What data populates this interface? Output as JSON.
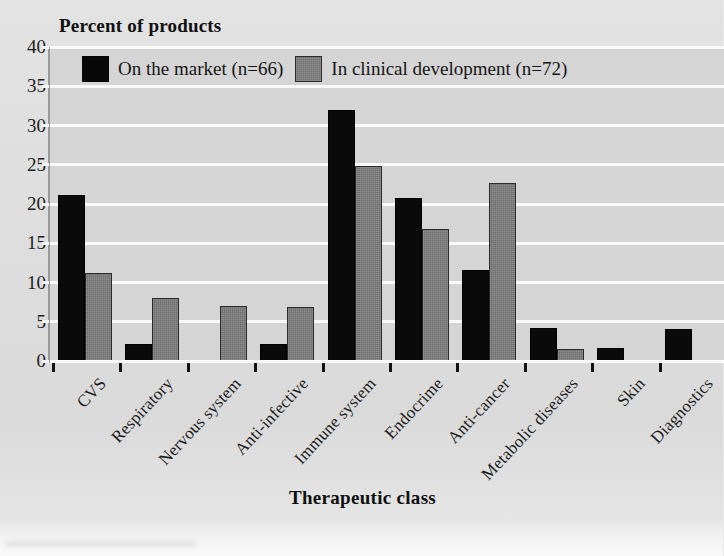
{
  "chart_data": {
    "type": "bar",
    "title": "",
    "ylabel": "Percent of products",
    "xlabel": "Therapeutic class",
    "ylim": [
      0,
      40
    ],
    "yticks": [
      0,
      5,
      10,
      15,
      20,
      25,
      30,
      35,
      40
    ],
    "grid": true,
    "legend_position": "top-left inside plot",
    "categories": [
      "CVS",
      "Respiratory",
      "Nervous system",
      "Anti-infective",
      "Immune system",
      "Endocrime",
      "Anti-cancer",
      "Metabolic diseases",
      "Skin",
      "Diagnostics"
    ],
    "series": [
      {
        "name": "On the market (n=66)",
        "color": "#0a0a0a",
        "values": [
          20.9,
          1.9,
          0,
          1.9,
          31.7,
          20.5,
          11.4,
          3.9,
          1.4,
          3.8
        ]
      },
      {
        "name": "In clinical development (n=72)",
        "color": "#6f6f6f",
        "values": [
          10.9,
          7.8,
          6.7,
          6.6,
          24.6,
          16.5,
          22.4,
          1.3,
          0,
          0
        ]
      }
    ]
  },
  "colors": {
    "background": "#dcdcdc",
    "plot_background": "#d5d5d5",
    "gridline": "#fafafa",
    "series_market": "#0a0a0a",
    "series_clinical": "#6f6f6f",
    "text": "#1a1a1a"
  }
}
